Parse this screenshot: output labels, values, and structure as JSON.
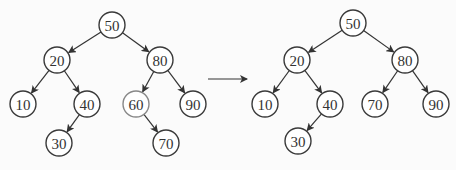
{
  "diagram": {
    "before": {
      "nodes": [
        {
          "id": "50",
          "label": "50",
          "x": 112,
          "y": 25
        },
        {
          "id": "20",
          "label": "20",
          "x": 57,
          "y": 60
        },
        {
          "id": "80",
          "label": "80",
          "x": 160,
          "y": 60
        },
        {
          "id": "10",
          "label": "10",
          "x": 23,
          "y": 104
        },
        {
          "id": "40",
          "label": "40",
          "x": 87,
          "y": 104
        },
        {
          "id": "60",
          "label": "60",
          "x": 136,
          "y": 104,
          "highlight": true
        },
        {
          "id": "90",
          "label": "90",
          "x": 193,
          "y": 104
        },
        {
          "id": "30",
          "label": "30",
          "x": 59,
          "y": 143
        },
        {
          "id": "70",
          "label": "70",
          "x": 166,
          "y": 143
        }
      ],
      "edges": [
        [
          "50",
          "20"
        ],
        [
          "50",
          "80"
        ],
        [
          "20",
          "10"
        ],
        [
          "20",
          "40"
        ],
        [
          "80",
          "60"
        ],
        [
          "80",
          "90"
        ],
        [
          "40",
          "30"
        ],
        [
          "60",
          "70"
        ]
      ]
    },
    "transition_arrow": {
      "x1": 208,
      "y1": 79,
      "x2": 247,
      "y2": 79
    },
    "after": {
      "nodes": [
        {
          "id": "50",
          "label": "50",
          "x": 353,
          "y": 23
        },
        {
          "id": "20",
          "label": "20",
          "x": 297,
          "y": 60
        },
        {
          "id": "80",
          "label": "80",
          "x": 405,
          "y": 60
        },
        {
          "id": "10",
          "label": "10",
          "x": 265,
          "y": 104
        },
        {
          "id": "40",
          "label": "40",
          "x": 330,
          "y": 104
        },
        {
          "id": "70",
          "label": "70",
          "x": 375,
          "y": 104
        },
        {
          "id": "90",
          "label": "90",
          "x": 436,
          "y": 104
        },
        {
          "id": "30",
          "label": "30",
          "x": 298,
          "y": 141
        }
      ],
      "edges": [
        [
          "50",
          "20"
        ],
        [
          "50",
          "80"
        ],
        [
          "20",
          "10"
        ],
        [
          "20",
          "40"
        ],
        [
          "80",
          "70"
        ],
        [
          "80",
          "90"
        ],
        [
          "40",
          "30"
        ]
      ]
    },
    "node_radius": 13
  }
}
